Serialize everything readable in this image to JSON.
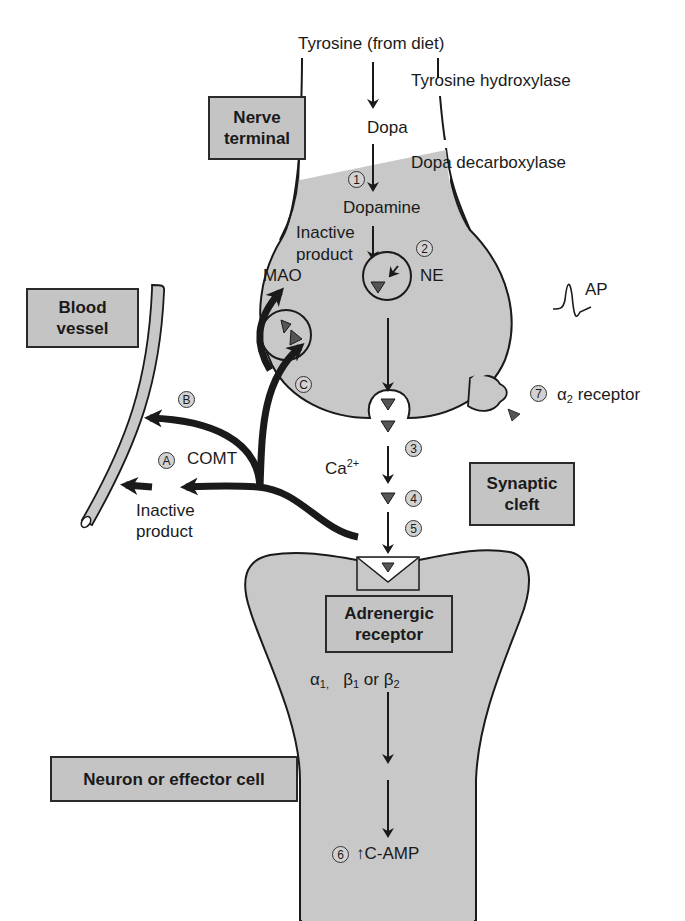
{
  "diagram": {
    "type": "adrenergic-synapse-neurotransmission",
    "colors": {
      "cell_fill": "#c8c8c8",
      "outline": "#1a1a1a",
      "label_box_fill": "#c4c4c4",
      "vessel_fill": "#c8c8c8",
      "neurotransmitter_fill": "#555555"
    },
    "region_labels": {
      "nerve_terminal": "Nerve terminal",
      "blood_vessel": "Blood vessel",
      "synaptic_cleft": "Synaptic cleft",
      "adrenergic_receptor": "Adrenergic receptor",
      "effector_cell": "Neuron or effector cell"
    },
    "synthesis": {
      "precursor": "Tyrosine (from diet)",
      "enzyme_1": "Tyrosine hydroxylase",
      "intermediate": "Dopa",
      "enzyme_2": "Dopa decarboxylase",
      "product": "Dopamine",
      "vesicle_product": "NE"
    },
    "metabolism": {
      "mao_label": "MAO",
      "mao_product": "Inactive product",
      "comt_label": "COMT",
      "comt_product": "Inactive product"
    },
    "release": {
      "ion": "Ca",
      "ion_charge": "2+",
      "action_potential": "AP"
    },
    "autoreceptor": {
      "greek": "α",
      "subscript": "2",
      "label": " receptor"
    },
    "postsynaptic": {
      "alpha": "α",
      "alpha_sub": "1,",
      "beta1": "β",
      "beta1_sub": "1",
      "or": " or ",
      "beta2": "β",
      "beta2_sub": "2",
      "second_messenger": "↑C-AMP"
    },
    "step_markers": {
      "s1": "1",
      "s2": "2",
      "s3": "3",
      "s4": "4",
      "s5": "5",
      "s6": "6",
      "s7": "7",
      "a": "A",
      "b": "B",
      "c": "C"
    }
  }
}
